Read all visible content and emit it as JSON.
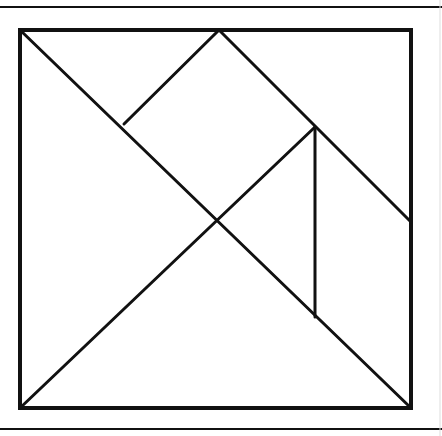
{
  "diagram": {
    "stroke_color": "#111111",
    "background": "#ffffff",
    "frame_rules": {
      "top": {
        "x1": 0,
        "y1": 7,
        "x2": 442,
        "y2": 7
      },
      "bottom": {
        "x1": 0,
        "y1": 429,
        "x2": 442,
        "y2": 429
      },
      "right_faint": {
        "x1": 440,
        "y1": 0,
        "x2": 440,
        "y2": 436
      }
    },
    "square": {
      "x": 20,
      "y": 30,
      "width": 391,
      "height": 378
    },
    "pieces": [
      {
        "name": "large-triangle-left",
        "points": "20,30 20,408 217,220"
      },
      {
        "name": "large-triangle-bottom",
        "points": "20,408 411,408 217,220"
      },
      {
        "name": "square-piece",
        "points": "219,30 315,127 217,220 124,124"
      },
      {
        "name": "small-triangle-top-left",
        "points": "20,30 219,30 124,124"
      },
      {
        "name": "small-triangle-center",
        "points": "217,220 315,127 315,317"
      },
      {
        "name": "parallelogram-right",
        "points": "315,127 411,222 411,408 315,317"
      },
      {
        "name": "medium-triangle-top-right",
        "points": "219,30 411,30 411,222"
      }
    ],
    "lines": [
      {
        "name": "diagonal-main",
        "x1": 20,
        "y1": 30,
        "x2": 411,
        "y2": 408
      },
      {
        "name": "diagonal-anti",
        "x1": 20,
        "y1": 408,
        "x2": 315,
        "y2": 127
      },
      {
        "name": "top-mid-to-diagonal",
        "x1": 219,
        "y1": 30,
        "x2": 124,
        "y2": 124
      },
      {
        "name": "top-mid-to-right-edge",
        "x1": 219,
        "y1": 30,
        "x2": 411,
        "y2": 222
      },
      {
        "name": "vertical-inner",
        "x1": 315,
        "y1": 127,
        "x2": 315,
        "y2": 317
      }
    ]
  }
}
